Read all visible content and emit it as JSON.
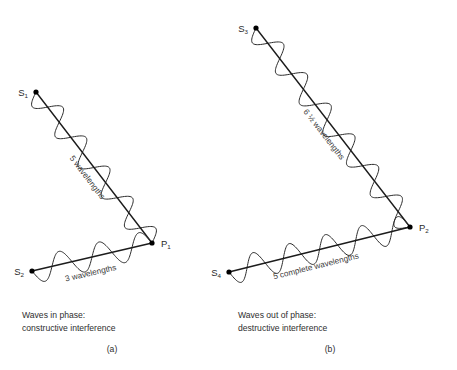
{
  "figure": {
    "background_color": "#ffffff",
    "stroke_color": "#2b2b2b",
    "width": 457,
    "height": 370
  },
  "panels": [
    {
      "id": "a",
      "tag": "(a)",
      "caption_line1": "Waves in phase:",
      "caption_line2": "constructive interference",
      "sources": [
        {
          "name": "source-s1",
          "label": "S",
          "subscript": "1",
          "x": 36,
          "y": 92
        },
        {
          "name": "source-s2",
          "label": "S",
          "subscript": "2",
          "x": 32,
          "y": 271
        }
      ],
      "point": {
        "name": "point-p1",
        "label": "P",
        "subscript": "1",
        "x": 152,
        "y": 243
      },
      "paths": [
        {
          "name": "diagonal-wave-a",
          "from": {
            "x": 36,
            "y": 92
          },
          "to": {
            "x": 152,
            "y": 243
          },
          "cycles": 5,
          "amplitude": 12,
          "label": "5 wavelengths",
          "label_fraction": "",
          "label_offset": 14,
          "label_t": 0.52
        },
        {
          "name": "horizontal-wave-a",
          "from": {
            "x": 32,
            "y": 271
          },
          "to": {
            "x": 152,
            "y": 243
          },
          "cycles": 3,
          "amplitude": 13,
          "label": "3 wavelengths",
          "label_fraction": "",
          "label_offset": 18,
          "label_t": 0.46
        }
      ]
    },
    {
      "id": "b",
      "tag": "(b)",
      "caption_line1": "Waves out of phase:",
      "caption_line2": "destructive interference",
      "sources": [
        {
          "name": "source-s3",
          "label": "S",
          "subscript": "3",
          "x": 256,
          "y": 28
        },
        {
          "name": "source-s4",
          "label": "S",
          "subscript": "4",
          "x": 229,
          "y": 272
        }
      ],
      "point": {
        "name": "point-p2",
        "label": "P",
        "subscript": "2",
        "x": 410,
        "y": 227
      },
      "paths": [
        {
          "name": "diagonal-wave-b",
          "from": {
            "x": 256,
            "y": 28
          },
          "to": {
            "x": 410,
            "y": 227
          },
          "cycles": 6.5,
          "amplitude": 12,
          "label": " wavelengths",
          "label_fraction": "6 ½",
          "label_offset": 14,
          "label_t": 0.5
        },
        {
          "name": "horizontal-wave-b",
          "from": {
            "x": 229,
            "y": 272
          },
          "to": {
            "x": 410,
            "y": 227
          },
          "cycles": 5,
          "amplitude": 13,
          "label": "5 complete wavelengths",
          "label_fraction": "",
          "label_offset": 18,
          "label_t": 0.46
        }
      ]
    }
  ],
  "captions": {
    "a": {
      "x": 22,
      "y": 318,
      "tag_x": 112,
      "tag_y": 352
    },
    "b": {
      "x": 238,
      "y": 318,
      "tag_x": 330,
      "tag_y": 352
    }
  }
}
